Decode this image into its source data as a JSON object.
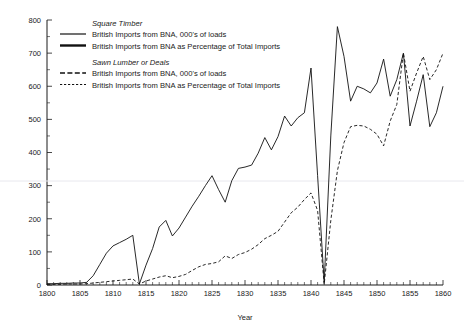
{
  "chart_data": {
    "type": "line",
    "title": "",
    "xlabel": "Year",
    "ylabel": "",
    "xlim": [
      1800,
      1860
    ],
    "ylim": [
      0,
      800
    ],
    "grid": false,
    "legend_position": "top-left-inside",
    "x_major_ticks": [
      1800,
      1805,
      1810,
      1815,
      1820,
      1825,
      1830,
      1835,
      1840,
      1845,
      1850,
      1855,
      1860
    ],
    "x_tick_labels": [
      "1800",
      "1805",
      "1810",
      "1815",
      "1820",
      "1825",
      "1830",
      "1835",
      "1840",
      "1845",
      "1850",
      "1855",
      "1860"
    ],
    "y_major_ticks": [
      0,
      100,
      200,
      300,
      400,
      500,
      600,
      700,
      800
    ],
    "y_tick_labels": [
      "0",
      "100",
      "200",
      "300",
      "400",
      "500",
      "600",
      "700",
      "800"
    ],
    "y_minor_step": 50,
    "x_minor_step": 1,
    "series": [
      {
        "name": "Square Timber — British Imports from BNA, 000's of loads",
        "style": "solid",
        "x": [
          1800,
          1801,
          1802,
          1803,
          1804,
          1805,
          1806,
          1807,
          1808,
          1809,
          1810,
          1811,
          1812,
          1813,
          1814,
          1815,
          1816,
          1817,
          1818,
          1819,
          1820,
          1821,
          1822,
          1823,
          1824,
          1825,
          1826,
          1827,
          1828,
          1829,
          1830,
          1831,
          1832,
          1833,
          1834,
          1835,
          1836,
          1837,
          1838,
          1839,
          1840,
          1841,
          1842,
          1843,
          1844,
          1845,
          1846,
          1847,
          1848,
          1849,
          1850,
          1851,
          1852,
          1853,
          1854,
          1855,
          1856,
          1857,
          1858,
          1859,
          1860
        ],
        "y": [
          4,
          4,
          5,
          5,
          6,
          6,
          8,
          28,
          62,
          96,
          118,
          128,
          138,
          150,
          3,
          60,
          110,
          175,
          195,
          148,
          172,
          205,
          238,
          268,
          300,
          330,
          288,
          250,
          315,
          352,
          356,
          362,
          398,
          445,
          408,
          448,
          510,
          480,
          505,
          520,
          655,
          330,
          8,
          450,
          780,
          690,
          555,
          600,
          592,
          580,
          610,
          682,
          570,
          620,
          700,
          480,
          555,
          635,
          478,
          520,
          600
        ]
      },
      {
        "name": "Sawn Lumber or Deals — British Imports from BNA, 000's of loads",
        "style": "dashed",
        "x": [
          1800,
          1801,
          1802,
          1803,
          1804,
          1805,
          1806,
          1807,
          1808,
          1809,
          1810,
          1811,
          1812,
          1813,
          1814,
          1815,
          1816,
          1817,
          1818,
          1819,
          1820,
          1821,
          1822,
          1823,
          1824,
          1825,
          1826,
          1827,
          1828,
          1829,
          1830,
          1831,
          1832,
          1833,
          1834,
          1835,
          1836,
          1837,
          1838,
          1839,
          1840,
          1841,
          1842,
          1843,
          1844,
          1845,
          1846,
          1847,
          1848,
          1849,
          1850,
          1851,
          1852,
          1853,
          1854,
          1855,
          1856,
          1857,
          1858,
          1859,
          1860
        ],
        "y": [
          2,
          2,
          2,
          3,
          3,
          3,
          4,
          6,
          8,
          10,
          12,
          14,
          16,
          18,
          3,
          12,
          18,
          24,
          28,
          22,
          26,
          32,
          44,
          55,
          62,
          65,
          70,
          88,
          80,
          92,
          98,
          108,
          122,
          140,
          150,
          162,
          190,
          218,
          235,
          258,
          278,
          225,
          2,
          195,
          345,
          430,
          478,
          482,
          480,
          470,
          455,
          420,
          495,
          545,
          700,
          585,
          640,
          690,
          620,
          650,
          700
        ]
      }
    ],
    "legend": [
      {
        "group": "Square Timber",
        "entries": [
          {
            "label": "British Imports from BNA, 000's of loads",
            "style": "solid-thin"
          },
          {
            "label": "British Imports from BNA as Percentage of Total Imports",
            "style": "solid-thick"
          }
        ]
      },
      {
        "group": "Sawn Lumber or Deals",
        "entries": [
          {
            "label": "British Imports from BNA, 000's of loads",
            "style": "dash-long"
          },
          {
            "label": "British Imports from BNA as Percentage of Total Imports",
            "style": "dash-short"
          }
        ]
      }
    ]
  }
}
